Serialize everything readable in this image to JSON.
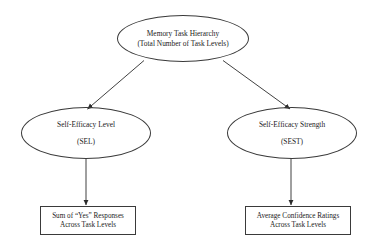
{
  "diagram": {
    "background_color": "#ffffff",
    "stroke_color": "#3a3a3a",
    "text_color": "#1b1b1b",
    "nodes": {
      "root": {
        "shape": "ellipse",
        "line1": "Memory Task Hierarchy",
        "line2": "(Total Number of Task Levels)"
      },
      "sel": {
        "shape": "ellipse",
        "line1": "Self-Efficacy Level",
        "line2": "(SEL)"
      },
      "sest": {
        "shape": "ellipse",
        "line1": "Self-Efficacy Strength",
        "line2": "(SEST)"
      },
      "sum_yes": {
        "shape": "rectangle",
        "line1": "Sum of “Yes” Responses",
        "line2": "Across Task Levels"
      },
      "avg_conf": {
        "shape": "rectangle",
        "line1": "Average Confidence Ratings",
        "line2": "Across Task Levels"
      }
    },
    "edges": [
      {
        "from": "root",
        "to": "sel",
        "style": "solid-arrow",
        "direction": "diagonal-left-down"
      },
      {
        "from": "root",
        "to": "sest",
        "style": "solid-arrow",
        "direction": "diagonal-right-down"
      },
      {
        "from": "sel",
        "to": "sum_yes",
        "style": "solid-arrow",
        "direction": "vertical-down"
      },
      {
        "from": "sest",
        "to": "avg_conf",
        "style": "solid-arrow",
        "direction": "vertical-down"
      }
    ]
  }
}
